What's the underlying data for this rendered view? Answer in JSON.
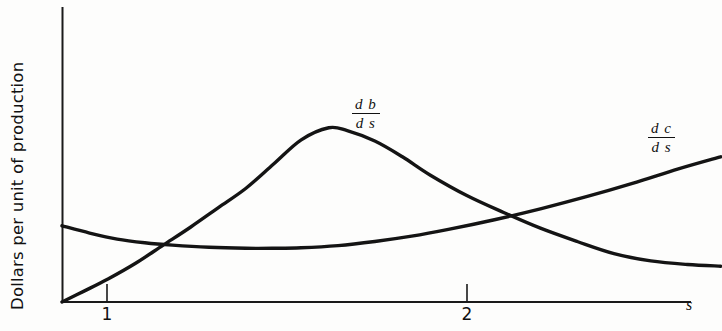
{
  "figure": {
    "background_color": "#fdfdfc",
    "ink_color": "#141414"
  },
  "axes": {
    "y_label": "Dollars per unit of production",
    "x_label": "s",
    "x_ticks": [
      {
        "label": "1",
        "x_px": 107
      },
      {
        "label": "2",
        "x_px": 467
      }
    ]
  },
  "labels": {
    "db_ds": {
      "numerator": "d b",
      "denominator": "d s"
    },
    "dc_ds": {
      "numerator": "d c",
      "denominator": "d s"
    }
  },
  "chart_data": {
    "type": "line",
    "title": "",
    "xlabel": "s",
    "ylabel": "Dollars per unit of production",
    "xlim": [
      0,
      3.5
    ],
    "ylim": [
      0,
      1
    ],
    "grid": false,
    "legend": "inline curve labels",
    "x_tick_labels": [
      "1",
      "2"
    ],
    "x_tick_values": [
      1,
      2
    ],
    "y_tick_labels": [],
    "annotations": [
      {
        "text": "d b / d s",
        "x": 1.72,
        "y": 0.66
      },
      {
        "text": "d c / d s",
        "x": 3.2,
        "y": 0.58
      }
    ],
    "series": [
      {
        "name": "db/ds",
        "label": "d b / d s",
        "color": "#141414",
        "x": [
          0.0,
          0.12,
          0.25,
          0.4,
          0.55,
          0.7,
          0.85,
          1.0,
          1.15,
          1.3,
          1.45,
          1.55,
          1.7,
          1.85,
          2.0,
          2.2,
          2.4,
          2.6,
          2.8,
          3.0,
          3.2,
          3.4,
          3.58
        ],
        "y": [
          0.0,
          0.045,
          0.095,
          0.16,
          0.235,
          0.31,
          0.39,
          0.47,
          0.57,
          0.67,
          0.72,
          0.708,
          0.665,
          0.6,
          0.525,
          0.44,
          0.37,
          0.305,
          0.25,
          0.2,
          0.17,
          0.155,
          0.148
        ]
      },
      {
        "name": "dc/ds",
        "label": "d c / d s",
        "color": "#141414",
        "x": [
          0.0,
          0.15,
          0.3,
          0.45,
          0.6,
          0.8,
          1.0,
          1.15,
          1.3,
          1.5,
          1.7,
          1.9,
          2.1,
          2.35,
          2.6,
          2.85,
          3.1,
          3.35,
          3.58
        ],
        "y": [
          0.315,
          0.285,
          0.26,
          0.245,
          0.235,
          0.226,
          0.222,
          0.222,
          0.224,
          0.233,
          0.25,
          0.272,
          0.3,
          0.34,
          0.385,
          0.435,
          0.49,
          0.55,
          0.6
        ]
      }
    ],
    "intersections": [
      {
        "x": 1.03,
        "y": 0.37
      },
      {
        "x": 1.95,
        "y": 0.29
      }
    ]
  }
}
